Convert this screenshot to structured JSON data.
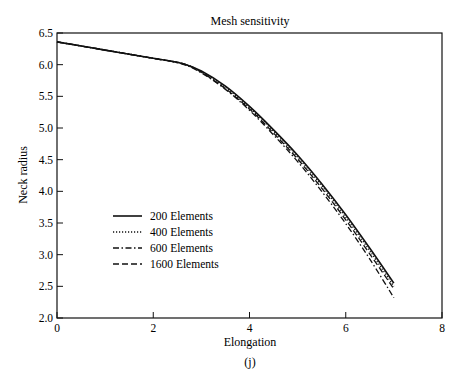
{
  "chart_data": {
    "type": "line",
    "title": "Mesh sensitivity",
    "xlabel": "Elongation",
    "ylabel": "Neck radius",
    "caption": "(j)",
    "xlim": [
      0,
      8
    ],
    "ylim": [
      2.0,
      6.5
    ],
    "xticks": [
      "0",
      "2",
      "4",
      "6",
      "8"
    ],
    "yticks": [
      "2.0",
      "2.5",
      "3.0",
      "3.5",
      "4.0",
      "4.5",
      "5.0",
      "5.5",
      "6.0",
      "6.5"
    ],
    "grid": false,
    "legend_position": "lower left (inside)",
    "x": [
      0,
      1,
      2,
      2.6,
      3,
      3.5,
      4,
      4.5,
      5,
      5.5,
      6,
      6.5,
      7
    ],
    "series": [
      {
        "name": "200 Elements",
        "style": "solid",
        "values": [
          6.36,
          6.23,
          6.1,
          6.02,
          5.9,
          5.66,
          5.34,
          4.97,
          4.57,
          4.12,
          3.63,
          3.1,
          2.55
        ]
      },
      {
        "name": "400 Elements",
        "style": "dotted",
        "values": [
          6.36,
          6.23,
          6.1,
          6.02,
          5.89,
          5.64,
          5.32,
          4.95,
          4.54,
          4.09,
          3.59,
          3.06,
          2.5
        ]
      },
      {
        "name": "600 Elements",
        "style": "dash-dot",
        "values": [
          6.36,
          6.23,
          6.1,
          6.01,
          5.87,
          5.61,
          5.28,
          4.89,
          4.47,
          4.0,
          3.49,
          2.93,
          2.32
        ]
      },
      {
        "name": "1600 Elements",
        "style": "dashed",
        "values": [
          6.36,
          6.23,
          6.1,
          6.02,
          5.88,
          5.62,
          5.3,
          4.92,
          4.51,
          4.05,
          3.55,
          3.01,
          2.46
        ]
      }
    ]
  }
}
